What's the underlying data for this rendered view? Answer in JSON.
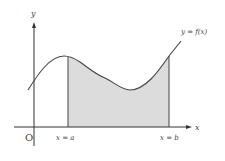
{
  "figure": {
    "colors": {
      "background": "#ffffff",
      "axis": "#333333",
      "curve": "#444444",
      "shaded_region": "#dcdcdc",
      "text": "#444444"
    },
    "axes": {
      "x_label": "x",
      "y_label": "y",
      "origin_label": "O"
    },
    "curve": {
      "label": "y = f(x)"
    },
    "bounds": {
      "left_label": "x = a",
      "right_label": "x = b"
    }
  }
}
